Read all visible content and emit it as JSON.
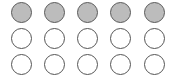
{
  "grid": {
    "rows": 3,
    "cols": 5,
    "filled_color": "#bcbcbc",
    "border_color": "#555555",
    "cells": [
      [
        "filled",
        "filled",
        "filled",
        "filled",
        "filled"
      ],
      [
        "empty",
        "empty",
        "empty",
        "empty",
        "empty"
      ],
      [
        "empty",
        "empty",
        "empty",
        "empty",
        "empty"
      ]
    ]
  }
}
